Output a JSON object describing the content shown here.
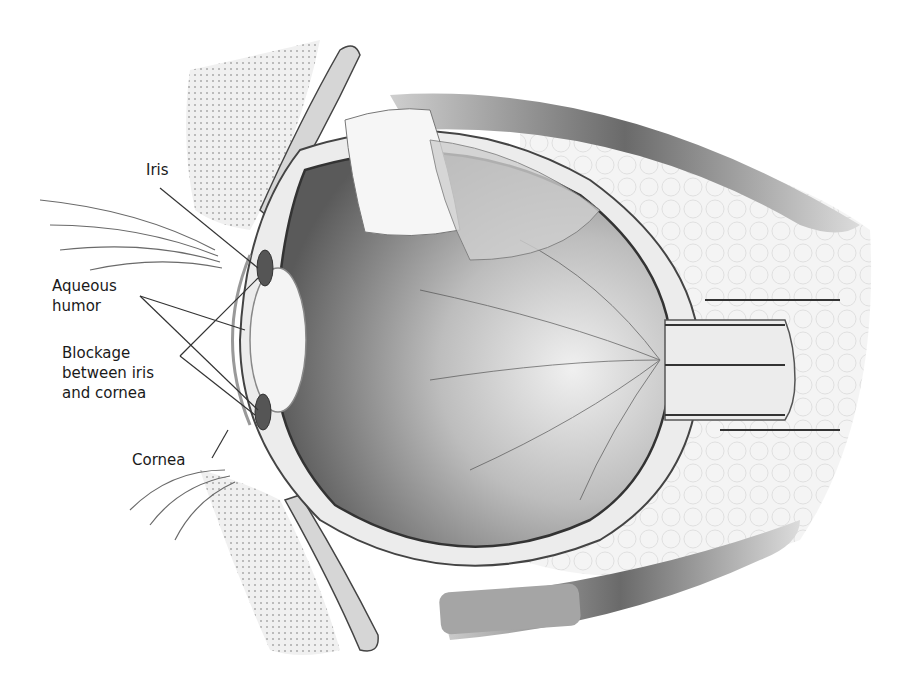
{
  "figure": {
    "style": "grayscale anatomical illustration",
    "colors": {
      "background": "#ffffff",
      "ink": "#1a1a1a",
      "leader": "#333333",
      "tissue_light": "#e6e6e6",
      "tissue_mid": "#a8a8a8",
      "tissue_dark": "#555555",
      "lens": "#f4f4f4"
    }
  },
  "labels": {
    "iris": "Iris",
    "aqueous_humor": "Aqueous\nhumor",
    "blockage": "Blockage\nbetween iris\nand cornea",
    "cornea": "Cornea"
  }
}
